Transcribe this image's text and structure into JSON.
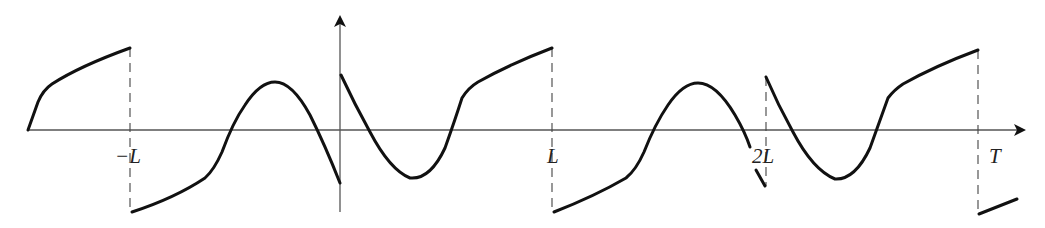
{
  "diagram": {
    "axes": {
      "horizontal_arrow": true,
      "vertical_arrow": true
    },
    "tick_labels": [
      {
        "id": "minus-L",
        "text": "−L"
      },
      {
        "id": "L",
        "text": "L"
      },
      {
        "id": "2L",
        "text": "2L"
      },
      {
        "id": "T",
        "text": "T"
      }
    ],
    "colors": {
      "curve": "#111111",
      "axis": "#555555",
      "dashed_guides": "#444444"
    }
  }
}
